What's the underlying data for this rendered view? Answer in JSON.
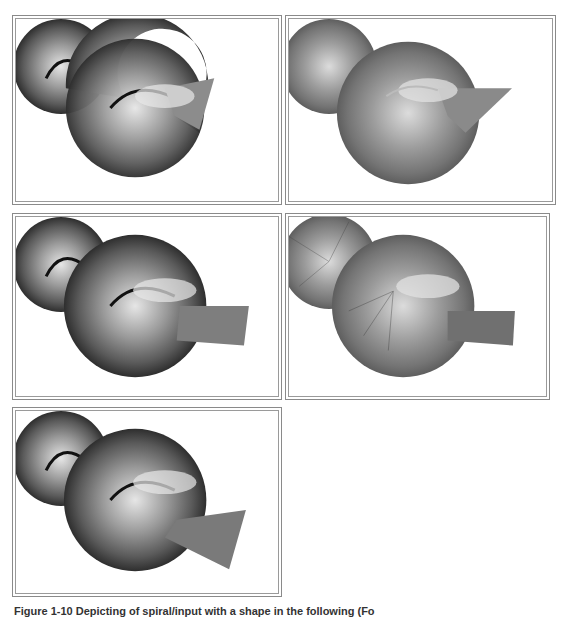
{
  "figure": {
    "caption": "Figure 1-10 Depicting of spiral/input with a shape in the following (Fo"
  },
  "panels": [
    {
      "id": "panel-1",
      "label": "Shell rendering variant 1",
      "style": "dark-ribbed",
      "cut": "angled-small"
    },
    {
      "id": "panel-2",
      "label": "Shell rendering variant 2",
      "style": "light-smooth",
      "cut": "angled-small"
    },
    {
      "id": "panel-3",
      "label": "Shell rendering variant 3",
      "style": "dark-ribbed",
      "cut": "flat-extended"
    },
    {
      "id": "panel-4",
      "label": "Shell rendering variant 4",
      "style": "light-lines",
      "cut": "flat-extended"
    },
    {
      "id": "panel-5",
      "label": "Shell rendering variant 5",
      "style": "dark-ribbed",
      "cut": "angled-long"
    }
  ],
  "colors": {
    "frame_border": "#8a8a8a",
    "shell_dark": "#3a3a3a",
    "shell_mid": "#6e6e6e",
    "shell_light": "#d8d8d8",
    "background": "#ffffff"
  }
}
